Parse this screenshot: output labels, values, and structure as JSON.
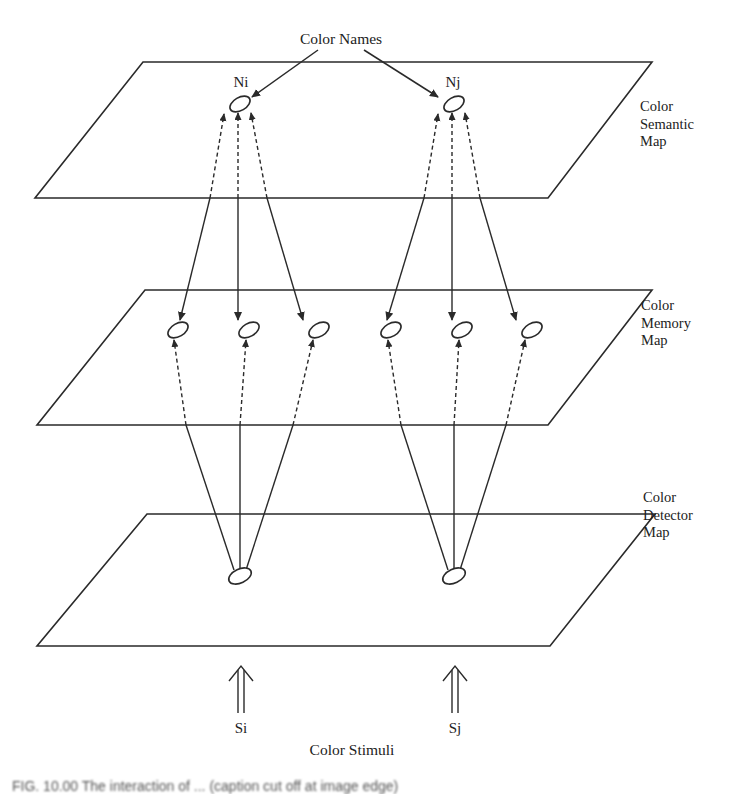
{
  "diagram": {
    "top_label": "Color Names",
    "bottom_label": "Color Stimuli",
    "nodes": {
      "semantic": [
        {
          "id": "Ni",
          "label": "Ni"
        },
        {
          "id": "Nj",
          "label": "Nj"
        }
      ],
      "stimuli": [
        {
          "id": "Si",
          "label": "Si"
        },
        {
          "id": "Sj",
          "label": "Sj"
        }
      ]
    },
    "layers": [
      {
        "id": "semantic",
        "lines": [
          "Color",
          "Semantic",
          "Map"
        ]
      },
      {
        "id": "memory",
        "lines": [
          "Color",
          "Memory",
          "Map"
        ]
      },
      {
        "id": "detector",
        "lines": [
          "Color",
          "Detector",
          "Map"
        ]
      }
    ],
    "caption": "FIG. 10.00  The interaction of ... (caption cut off at image edge)",
    "line_color": "#2a2a2a",
    "text_color": "#222222",
    "background": "#ffffff"
  }
}
